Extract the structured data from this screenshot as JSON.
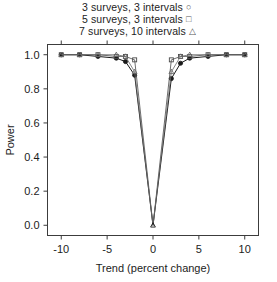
{
  "chart_data": {
    "type": "line",
    "title": "",
    "xlabel": "Trend (percent change)",
    "ylabel": "Power",
    "xlim": [
      -11.5,
      11.5
    ],
    "ylim": [
      -0.06,
      1.06
    ],
    "xticks": [
      -10,
      -5,
      0,
      5,
      10
    ],
    "xticklabels": [
      "-10",
      "-5",
      "0",
      "5",
      "10"
    ],
    "yticks": [
      0.0,
      0.2,
      0.4,
      0.6,
      0.8,
      1.0
    ],
    "yticklabels": [
      "0.0",
      "0.2",
      "0.4",
      "0.6",
      "0.8",
      "1.0"
    ],
    "grid": false,
    "legend_position": "top-center",
    "frame": "box",
    "series": [
      {
        "name": "3 surveys, 3 intervals",
        "marker": "circle",
        "color": "#1a1a1a",
        "x": [
          -10,
          -8,
          -6,
          -4,
          -3,
          -2,
          0,
          2,
          3,
          4,
          6,
          8,
          10
        ],
        "values": [
          1.0,
          1.0,
          0.99,
          0.98,
          0.96,
          0.88,
          0.0,
          0.86,
          0.95,
          0.98,
          0.99,
          1.0,
          1.0
        ]
      },
      {
        "name": "5 surveys, 3 intervals",
        "marker": "square",
        "color": "#4a4a4a",
        "x": [
          -10,
          -8,
          -6,
          -4,
          -3,
          -2,
          0,
          2,
          3,
          4,
          6,
          8,
          10
        ],
        "values": [
          1.0,
          1.0,
          1.0,
          0.99,
          0.99,
          0.97,
          0.0,
          0.97,
          0.99,
          0.99,
          1.0,
          1.0,
          1.0
        ]
      },
      {
        "name": "7 surveys, 10 intervals",
        "marker": "triangle",
        "color": "#6a6a6a",
        "x": [
          -10,
          -8,
          -6,
          -4,
          -3,
          -2,
          0,
          2,
          3,
          4,
          6,
          8,
          10
        ],
        "values": [
          1.0,
          1.0,
          1.0,
          1.0,
          0.99,
          0.9,
          0.0,
          0.9,
          0.99,
          1.0,
          1.0,
          1.0,
          1.0
        ]
      }
    ]
  },
  "legend": {
    "entries": [
      {
        "label": "3 surveys, 3 intervals",
        "glyph": "○"
      },
      {
        "label": "5 surveys, 3 intervals",
        "glyph": "□"
      },
      {
        "label": "7 surveys, 10 intervals",
        "glyph": "△"
      }
    ]
  },
  "axes": {
    "x_title": "Trend (percent change)",
    "y_title": "Power",
    "x_tick_labels": [
      "-10",
      "-5",
      "0",
      "5",
      "10"
    ],
    "y_tick_labels": [
      "0.0",
      "0.2",
      "0.4",
      "0.6",
      "0.8",
      "1.0"
    ]
  },
  "colors": {
    "frame": "#3c3c3c",
    "series1": "#1a1a1a",
    "series2": "#4a4a4a",
    "series3": "#6a6a6a",
    "text": "#1c1c1c",
    "background": "#ffffff"
  }
}
